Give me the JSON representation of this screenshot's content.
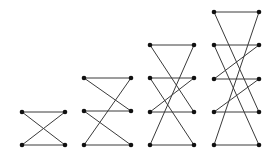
{
  "diagram": {
    "colors": {
      "edge": "#3a3a3a",
      "node": "#111111",
      "background": "#ffffff"
    },
    "figures": [
      {
        "name": "ladder-2",
        "left_x": 22,
        "right_x": 65,
        "rows_y": [
          112,
          145
        ],
        "edges": [
          [
            [
              "L",
              0
            ],
            [
              "R",
              0
            ]
          ],
          [
            [
              "L",
              1
            ],
            [
              "R",
              1
            ]
          ],
          [
            [
              "L",
              0
            ],
            [
              "R",
              1
            ]
          ],
          [
            [
              "L",
              1
            ],
            [
              "R",
              0
            ]
          ]
        ]
      },
      {
        "name": "ladder-3",
        "left_x": 84,
        "right_x": 131,
        "rows_y": [
          78,
          111,
          145
        ],
        "edges": [
          [
            [
              "L",
              0
            ],
            [
              "R",
              0
            ]
          ],
          [
            [
              "L",
              1
            ],
            [
              "R",
              1
            ]
          ],
          [
            [
              "L",
              2
            ],
            [
              "R",
              2
            ]
          ],
          [
            [
              "L",
              0
            ],
            [
              "R",
              1
            ]
          ],
          [
            [
              "L",
              1
            ],
            [
              "R",
              2
            ]
          ],
          [
            [
              "L",
              2
            ],
            [
              "R",
              0
            ]
          ]
        ]
      },
      {
        "name": "ladder-4",
        "left_x": 150,
        "right_x": 194,
        "rows_y": [
          45,
          78,
          112,
          145
        ],
        "edges": [
          [
            [
              "L",
              0
            ],
            [
              "R",
              0
            ]
          ],
          [
            [
              "L",
              1
            ],
            [
              "R",
              1
            ]
          ],
          [
            [
              "L",
              2
            ],
            [
              "R",
              2
            ]
          ],
          [
            [
              "L",
              3
            ],
            [
              "R",
              3
            ]
          ],
          [
            [
              "L",
              0
            ],
            [
              "R",
              2
            ]
          ],
          [
            [
              "L",
              1
            ],
            [
              "R",
              3
            ]
          ],
          [
            [
              "L",
              2
            ],
            [
              "R",
              1
            ]
          ],
          [
            [
              "L",
              3
            ],
            [
              "R",
              0
            ]
          ]
        ]
      },
      {
        "name": "ladder-5",
        "left_x": 214,
        "right_x": 259,
        "rows_y": [
          12,
          45,
          79,
          112,
          145
        ],
        "edges": [
          [
            [
              "L",
              0
            ],
            [
              "R",
              0
            ]
          ],
          [
            [
              "L",
              1
            ],
            [
              "R",
              1
            ]
          ],
          [
            [
              "L",
              2
            ],
            [
              "R",
              2
            ]
          ],
          [
            [
              "L",
              3
            ],
            [
              "R",
              3
            ]
          ],
          [
            [
              "L",
              4
            ],
            [
              "R",
              4
            ]
          ],
          [
            [
              "L",
              0
            ],
            [
              "R",
              3
            ]
          ],
          [
            [
              "L",
              1
            ],
            [
              "R",
              4
            ]
          ],
          [
            [
              "L",
              2
            ],
            [
              "R",
              1
            ]
          ],
          [
            [
              "L",
              3
            ],
            [
              "R",
              2
            ]
          ],
          [
            [
              "L",
              4
            ],
            [
              "R",
              0
            ]
          ]
        ]
      }
    ]
  }
}
